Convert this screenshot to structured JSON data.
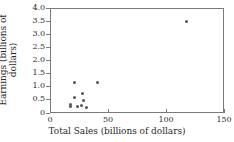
{
  "chart_data": {
    "type": "scatter",
    "title": "",
    "xlabel": "Total Sales (billions of dollars)",
    "ylabel": "Earnings (billions of dollars)",
    "xlim": [
      0,
      150
    ],
    "ylim": [
      0,
      4.0
    ],
    "xticks": [
      0,
      50,
      100,
      150
    ],
    "xtick_labels": [
      "0",
      "50",
      "100",
      "150"
    ],
    "yticks": [
      0,
      0.5,
      1.0,
      1.5,
      2.0,
      2.5,
      3.0,
      3.5,
      4.0
    ],
    "ytick_labels": [
      "0",
      "0.5",
      "1.0",
      "1.5",
      "2.0",
      "2.5",
      "3.0",
      "3.5",
      "4.0"
    ],
    "grid": false,
    "legend": null,
    "marker_color": "#555555",
    "frame_color": "#7a7a7a",
    "background_color": "#ffffff",
    "points": [
      {
        "x": 17,
        "y": 0.3
      },
      {
        "x": 17,
        "y": 0.38
      },
      {
        "x": 20,
        "y": 0.62
      },
      {
        "x": 20,
        "y": 1.2
      },
      {
        "x": 23,
        "y": 0.28
      },
      {
        "x": 26,
        "y": 0.32
      },
      {
        "x": 27,
        "y": 0.78
      },
      {
        "x": 28,
        "y": 0.5
      },
      {
        "x": 31,
        "y": 0.25
      },
      {
        "x": 40,
        "y": 1.2
      },
      {
        "x": 117,
        "y": 3.52
      }
    ]
  }
}
